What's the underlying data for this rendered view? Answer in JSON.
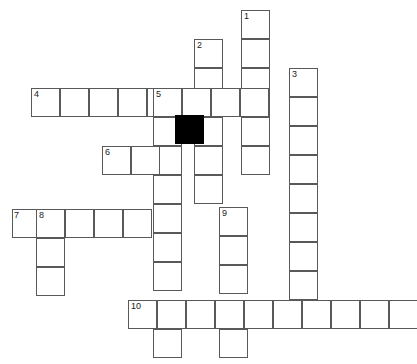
{
  "puzzle": {
    "title": "Crossword Puzzle Grid",
    "cell_size": 29,
    "grid_origin": {
      "x": 12,
      "y": 10
    },
    "colors": {
      "cell_fill": "#ffffff",
      "cell_border": "#58595b",
      "blocked_fill": "#000000",
      "number_text": "#1a1a1a",
      "background": "#ffffff"
    },
    "entries": [
      {
        "number": "1",
        "direction": "down",
        "col": 8,
        "row": 0,
        "length": 6
      },
      {
        "number": "2",
        "direction": "down",
        "col": 6,
        "row": 1,
        "length": 6
      },
      {
        "number": "3",
        "direction": "down",
        "col": 10,
        "row": 2,
        "length": 8
      },
      {
        "number": "4",
        "direction": "across",
        "col": 0,
        "row": 3,
        "length": 8
      },
      {
        "number": "5",
        "direction": "down",
        "col": 5,
        "row": 3,
        "length": 9
      },
      {
        "number": "6",
        "direction": "across",
        "col": 3,
        "row": 5,
        "length": 4
      },
      {
        "number": "7",
        "direction": "across",
        "col": -1,
        "row": 7,
        "length": 6
      },
      {
        "number": "8",
        "direction": "down",
        "col": 0,
        "row": 7,
        "length": 3
      },
      {
        "number": "9",
        "direction": "down",
        "col": 7,
        "row": 7,
        "length": 5
      },
      {
        "number": "10",
        "direction": "across",
        "col": 4,
        "row": 10,
        "length": 10
      }
    ],
    "cells": [
      {
        "x": 241,
        "y": 10,
        "num": "1"
      },
      {
        "x": 241,
        "y": 39,
        "num": ""
      },
      {
        "x": 241,
        "y": 68,
        "num": ""
      },
      {
        "x": 241,
        "y": 88,
        "num": ""
      },
      {
        "x": 241,
        "y": 117,
        "num": ""
      },
      {
        "x": 241,
        "y": 146,
        "num": ""
      },
      {
        "x": 194,
        "y": 39,
        "num": "2"
      },
      {
        "x": 194,
        "y": 68,
        "num": ""
      },
      {
        "x": 194,
        "y": 88,
        "num": ""
      },
      {
        "x": 194,
        "y": 117,
        "num": ""
      },
      {
        "x": 194,
        "y": 146,
        "num": ""
      },
      {
        "x": 194,
        "y": 175,
        "num": ""
      },
      {
        "x": 289,
        "y": 68,
        "num": "3"
      },
      {
        "x": 289,
        "y": 97,
        "num": ""
      },
      {
        "x": 289,
        "y": 126,
        "num": ""
      },
      {
        "x": 289,
        "y": 155,
        "num": ""
      },
      {
        "x": 289,
        "y": 184,
        "num": ""
      },
      {
        "x": 289,
        "y": 213,
        "num": ""
      },
      {
        "x": 289,
        "y": 242,
        "num": ""
      },
      {
        "x": 289,
        "y": 271,
        "num": ""
      },
      {
        "x": 31,
        "y": 88,
        "num": "4"
      },
      {
        "x": 60,
        "y": 88,
        "num": ""
      },
      {
        "x": 89,
        "y": 88,
        "num": ""
      },
      {
        "x": 118,
        "y": 88,
        "num": ""
      },
      {
        "x": 147,
        "y": 88,
        "num": ""
      },
      {
        "x": 153,
        "y": 88,
        "num": "5"
      },
      {
        "x": 182,
        "y": 88,
        "num": ""
      },
      {
        "x": 211,
        "y": 88,
        "num": ""
      },
      {
        "x": 240,
        "y": 88,
        "num": ""
      },
      {
        "x": 153,
        "y": 117,
        "num": ""
      },
      {
        "x": 153,
        "y": 146,
        "num": ""
      },
      {
        "x": 153,
        "y": 175,
        "num": ""
      },
      {
        "x": 153,
        "y": 204,
        "num": ""
      },
      {
        "x": 153,
        "y": 233,
        "num": ""
      },
      {
        "x": 153,
        "y": 262,
        "num": ""
      },
      {
        "x": 153,
        "y": 300,
        "num": ""
      },
      {
        "x": 153,
        "y": 329,
        "num": ""
      },
      {
        "x": 102,
        "y": 146,
        "num": "6"
      },
      {
        "x": 131,
        "y": 146,
        "num": ""
      },
      {
        "x": 12,
        "y": 209,
        "num": "7"
      },
      {
        "x": 36,
        "y": 209,
        "num": "8"
      },
      {
        "x": 65,
        "y": 209,
        "num": ""
      },
      {
        "x": 94,
        "y": 209,
        "num": ""
      },
      {
        "x": 123,
        "y": 209,
        "num": ""
      },
      {
        "x": 36,
        "y": 238,
        "num": ""
      },
      {
        "x": 36,
        "y": 267,
        "num": ""
      },
      {
        "x": 219,
        "y": 207,
        "num": "9"
      },
      {
        "x": 219,
        "y": 236,
        "num": ""
      },
      {
        "x": 219,
        "y": 265,
        "num": ""
      },
      {
        "x": 219,
        "y": 300,
        "num": ""
      },
      {
        "x": 219,
        "y": 329,
        "num": ""
      },
      {
        "x": 128,
        "y": 300,
        "num": "10"
      },
      {
        "x": 157,
        "y": 300,
        "num": ""
      },
      {
        "x": 186,
        "y": 300,
        "num": ""
      },
      {
        "x": 215,
        "y": 300,
        "num": ""
      },
      {
        "x": 244,
        "y": 300,
        "num": ""
      },
      {
        "x": 273,
        "y": 300,
        "num": ""
      },
      {
        "x": 302,
        "y": 300,
        "num": ""
      },
      {
        "x": 331,
        "y": 300,
        "num": ""
      },
      {
        "x": 360,
        "y": 300,
        "num": ""
      },
      {
        "x": 389,
        "y": 300,
        "num": ""
      }
    ],
    "blocked_cells": [
      {
        "x": 175,
        "y": 115
      }
    ],
    "numbers": [
      {
        "label": "1",
        "x": 244,
        "y": 11
      },
      {
        "label": "2",
        "x": 197,
        "y": 40
      },
      {
        "label": "3",
        "x": 292,
        "y": 69
      },
      {
        "label": "4",
        "x": 34,
        "y": 89
      },
      {
        "label": "5",
        "x": 156,
        "y": 89
      },
      {
        "label": "6",
        "x": 105,
        "y": 147
      },
      {
        "label": "7",
        "x": 14,
        "y": 210
      },
      {
        "label": "8",
        "x": 39,
        "y": 210
      },
      {
        "label": "9",
        "x": 222,
        "y": 208
      },
      {
        "label": "10",
        "x": 131,
        "y": 301
      }
    ]
  }
}
